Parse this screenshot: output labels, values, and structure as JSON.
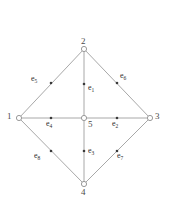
{
  "figure": {
    "type": "undirected-graph-diagram",
    "background_color": "#ffffff",
    "edge_color": "#a8a8a8",
    "vertex_stroke_color": "#9a9a9a",
    "vertex_fill_color": "#ffffff",
    "label_color": "#2e2e2e",
    "vertex_label_color": "#4a4a4a",
    "midpoint_marker_color": "#3a3a3a",
    "width": 170,
    "height": 204
  },
  "vertices": [
    {
      "id": "v1",
      "label": "1",
      "x": 19,
      "y": 118,
      "label_x": 7,
      "label_y": 112
    },
    {
      "id": "v2",
      "label": "2",
      "x": 84,
      "y": 49,
      "label_x": 81,
      "label_y": 37
    },
    {
      "id": "v3",
      "label": "3",
      "x": 150,
      "y": 118,
      "label_x": 155,
      "label_y": 112
    },
    {
      "id": "v4",
      "label": "4",
      "x": 84,
      "y": 184,
      "label_x": 81,
      "label_y": 188
    },
    {
      "id": "v5",
      "label": "5",
      "x": 84,
      "y": 118,
      "label_x": 88,
      "label_y": 120
    }
  ],
  "edges": [
    {
      "id": "e1",
      "label": "e",
      "sub": "1",
      "from": "v5",
      "to": "v2",
      "mid_x": 84,
      "mid_y": 84,
      "label_x": 88,
      "label_y": 84
    },
    {
      "id": "e2",
      "label": "e",
      "sub": "2",
      "from": "v5",
      "to": "v3",
      "mid_x": 117,
      "mid_y": 118,
      "label_x": 112,
      "label_y": 120
    },
    {
      "id": "e3",
      "label": "e",
      "sub": "3",
      "from": "v5",
      "to": "v4",
      "mid_x": 84,
      "mid_y": 151,
      "label_x": 88,
      "label_y": 147
    },
    {
      "id": "e4",
      "label": "e",
      "sub": "4",
      "from": "v5",
      "to": "v1",
      "mid_x": 51,
      "mid_y": 118,
      "label_x": 46,
      "label_y": 120
    },
    {
      "id": "e5",
      "label": "e",
      "sub": "5",
      "from": "v1",
      "to": "v2",
      "mid_x": 51,
      "mid_y": 83,
      "label_x": 31,
      "label_y": 75
    },
    {
      "id": "e6",
      "label": "e",
      "sub": "6",
      "from": "v2",
      "to": "v3",
      "mid_x": 117,
      "mid_y": 83,
      "label_x": 120,
      "label_y": 72
    },
    {
      "id": "e7",
      "label": "e",
      "sub": "7",
      "from": "v3",
      "to": "v4",
      "mid_x": 117,
      "mid_y": 151,
      "label_x": 117,
      "label_y": 152
    },
    {
      "id": "e8",
      "label": "e",
      "sub": "8",
      "from": "v1",
      "to": "v4",
      "mid_x": 51,
      "mid_y": 151,
      "label_x": 34,
      "label_y": 152
    }
  ]
}
